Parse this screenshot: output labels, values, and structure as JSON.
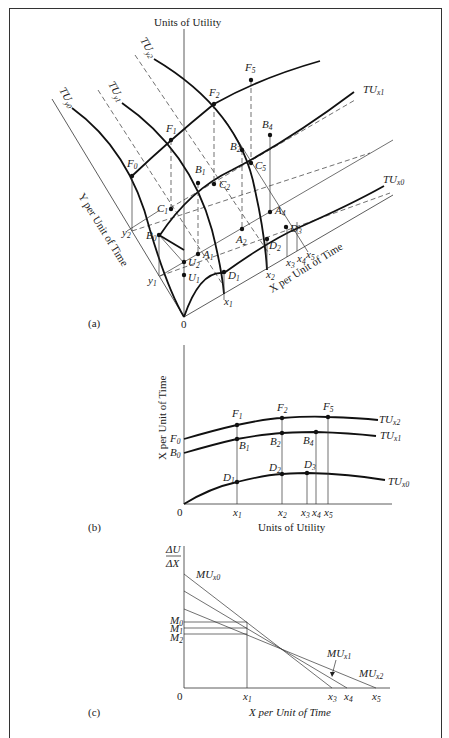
{
  "panel_a": {
    "label": "(a)",
    "axis_vertical": "Units of Utility",
    "axis_left": "Y per Unit of Time",
    "axis_right": "X per Unit of Time",
    "origin": "0",
    "curves": {
      "tu_y0": "TU",
      "tu_y0_sub": "y0",
      "tu_y1": "TU",
      "tu_y1_sub": "y1",
      "tu_y2": "TU",
      "tu_y2_sub": "y2",
      "tu_x0": "TU",
      "tu_x0_sub": "x0",
      "tu_x1": "TU",
      "tu_x1_sub": "x1"
    },
    "points": [
      "F0",
      "F1",
      "F2",
      "F5",
      "B0",
      "B1",
      "B2",
      "B4",
      "C1",
      "C2",
      "C5",
      "A1",
      "A2",
      "A4",
      "D1",
      "D2",
      "D3",
      "U1",
      "U2"
    ],
    "ticks_y": [
      "y1",
      "y2"
    ],
    "ticks_x": [
      "x1",
      "x2",
      "x3",
      "x4",
      "x5"
    ]
  },
  "panel_b": {
    "label": "(b)",
    "xlabel": "Units of Utility",
    "ylabel": "X per Unit of Time",
    "origin": "0",
    "y_ticks": [
      "F0",
      "B0"
    ],
    "x_ticks": [
      "x1",
      "x2",
      "x3",
      "x4",
      "x5"
    ],
    "curves": [
      {
        "name": "TU",
        "sub": "x2",
        "points": [
          "F1",
          "F2",
          "F5"
        ]
      },
      {
        "name": "TU",
        "sub": "x1",
        "points": [
          "B1",
          "B2",
          "B4"
        ]
      },
      {
        "name": "TU",
        "sub": "x0",
        "points": [
          "D1",
          "D2",
          "D3"
        ]
      }
    ]
  },
  "panel_c": {
    "label": "(c)",
    "ylabel_num": "ΔU",
    "ylabel_den": "ΔX",
    "xlabel": "X per Unit of Time",
    "origin": "0",
    "y_ticks": [
      "M0",
      "M1",
      "M2"
    ],
    "x_ticks": [
      "x1",
      "x3",
      "x4",
      "x5"
    ],
    "curves": [
      {
        "name": "MU",
        "sub": "x0"
      },
      {
        "name": "MU",
        "sub": "x1"
      },
      {
        "name": "MU",
        "sub": "x2"
      }
    ]
  }
}
